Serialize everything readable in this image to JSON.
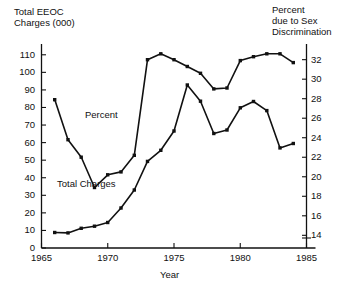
{
  "chart_data": {
    "type": "line",
    "title": "",
    "xlabel": "Year",
    "ylabel": "Total EEOC Charges (000)",
    "y2label": "Percent due to Sex Discrimination",
    "left_axis_title_lines": [
      "Total EEOC",
      "Charges (000)"
    ],
    "right_axis_title_lines": [
      "Percent",
      "due to Sex",
      "Discrimination"
    ],
    "xlim": [
      1965,
      1985
    ],
    "xticks": [
      1965,
      1970,
      1975,
      1980,
      1985
    ],
    "xticklabels": [
      "1965",
      "1970",
      "1975",
      "1980",
      "1985"
    ],
    "ylim": [
      0,
      115
    ],
    "yticks": [
      0,
      10,
      20,
      30,
      40,
      50,
      60,
      70,
      80,
      90,
      100,
      110
    ],
    "yticklabels": [
      "0",
      "10",
      "20",
      "30",
      "40",
      "50",
      "60",
      "70",
      "80",
      "90",
      "100",
      "110"
    ],
    "y2lim": [
      12.7,
      33.4
    ],
    "y2ticks": [
      14,
      16,
      18,
      20,
      22,
      24,
      26,
      28,
      30,
      32
    ],
    "y2ticklabels": [
      "14",
      "16",
      "18",
      "20",
      "22",
      "24",
      "26",
      "28",
      "30",
      "32"
    ],
    "grid": false,
    "legend": "inline-annotations",
    "markers": "filled-square",
    "x": [
      1966,
      1967,
      1968,
      1969,
      1970,
      1971,
      1972,
      1973,
      1974,
      1975,
      1976,
      1977,
      1978,
      1979,
      1980,
      1981,
      1982,
      1983,
      1984
    ],
    "series": [
      {
        "name": "Total Charges",
        "axis": "left",
        "unit": "thousands of charges",
        "values": [
          8.8,
          8.6,
          11.2,
          12.4,
          14.5,
          22.8,
          33.0,
          49.3,
          55.6,
          66.6,
          92.8,
          83.6,
          65.2,
          67.2,
          79.8,
          83.4,
          78.2,
          57.0,
          59.5
        ]
      },
      {
        "name": "Percent",
        "axis": "right",
        "unit": "percent due to sex discrimination",
        "values": [
          27.9,
          23.8,
          22.0,
          18.9,
          20.2,
          20.5,
          22.2,
          32.0,
          32.6,
          32.0,
          31.3,
          30.6,
          29.0,
          29.1,
          31.9,
          32.3,
          32.6,
          32.6,
          31.7
        ]
      }
    ],
    "annotations": [
      {
        "name": "percent-label",
        "text": "Percent"
      },
      {
        "name": "total-charges-label",
        "text": "Total Charges"
      }
    ]
  }
}
